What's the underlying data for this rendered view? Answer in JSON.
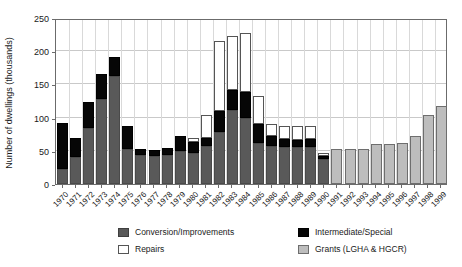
{
  "chart_data": {
    "type": "bar",
    "stacked": true,
    "title": "",
    "xlabel": "",
    "ylabel": "Number of dwellings (thousands)",
    "ylim": [
      0,
      250
    ],
    "yticks": [
      0,
      50,
      100,
      150,
      200,
      250
    ],
    "grid": true,
    "legend_position": "bottom",
    "categories": [
      "1970",
      "1971",
      "1972",
      "1973",
      "1974",
      "1975",
      "1976",
      "1977",
      "1978",
      "1979",
      "1980",
      "1981",
      "1982",
      "1983",
      "1984",
      "1985",
      "1986",
      "1987",
      "1988",
      "1989",
      "1990",
      "1991",
      "1992",
      "1993",
      "1994",
      "1995",
      "1996",
      "1997",
      "1998",
      "1999"
    ],
    "series": [
      {
        "name": "Conversion/Improvements",
        "color": "#595959",
        "values": [
          22,
          40,
          84,
          128,
          162,
          52,
          44,
          42,
          43,
          50,
          47,
          57,
          78,
          111,
          100,
          62,
          58,
          56,
          55,
          56,
          37,
          0,
          0,
          0,
          0,
          0,
          0,
          0,
          0,
          0
        ]
      },
      {
        "name": "Intermediate/Special",
        "color": "#060606",
        "values": [
          70,
          29,
          39,
          38,
          30,
          35,
          9,
          10,
          11,
          22,
          17,
          13,
          32,
          30,
          38,
          28,
          14,
          12,
          12,
          12,
          5,
          0,
          0,
          0,
          0,
          0,
          0,
          0,
          0,
          0
        ]
      },
      {
        "name": "Repairs",
        "color": "#ffffff",
        "values": [
          0,
          0,
          0,
          0,
          0,
          0,
          0,
          0,
          0,
          0,
          6,
          34,
          105,
          82,
          90,
          43,
          18,
          19,
          20,
          20,
          4,
          0,
          0,
          0,
          0,
          0,
          0,
          0,
          0,
          0
        ]
      },
      {
        "name": "Grants (LGHA & HGCR)",
        "color": "#bdbdbd",
        "values": [
          0,
          0,
          0,
          0,
          0,
          0,
          0,
          0,
          0,
          0,
          0,
          0,
          0,
          0,
          0,
          0,
          0,
          0,
          0,
          0,
          0,
          52,
          52,
          53,
          60,
          61,
          62,
          72,
          104,
          118
        ]
      }
    ],
    "totals": [
      92,
      69,
      123,
      166,
      192,
      87,
      53,
      52,
      54,
      72,
      70,
      104,
      215,
      223,
      228,
      133,
      90,
      87,
      87,
      88,
      46,
      52,
      52,
      53,
      60,
      61,
      62,
      72,
      104,
      118
    ]
  },
  "legend": {
    "items": [
      {
        "label": "Conversion/Improvements",
        "swatch": "conv"
      },
      {
        "label": "Intermediate/Special",
        "swatch": "inter"
      },
      {
        "label": "Repairs",
        "swatch": "rep"
      },
      {
        "label": "Grants (LGHA & HGCR)",
        "swatch": "grant"
      }
    ]
  }
}
